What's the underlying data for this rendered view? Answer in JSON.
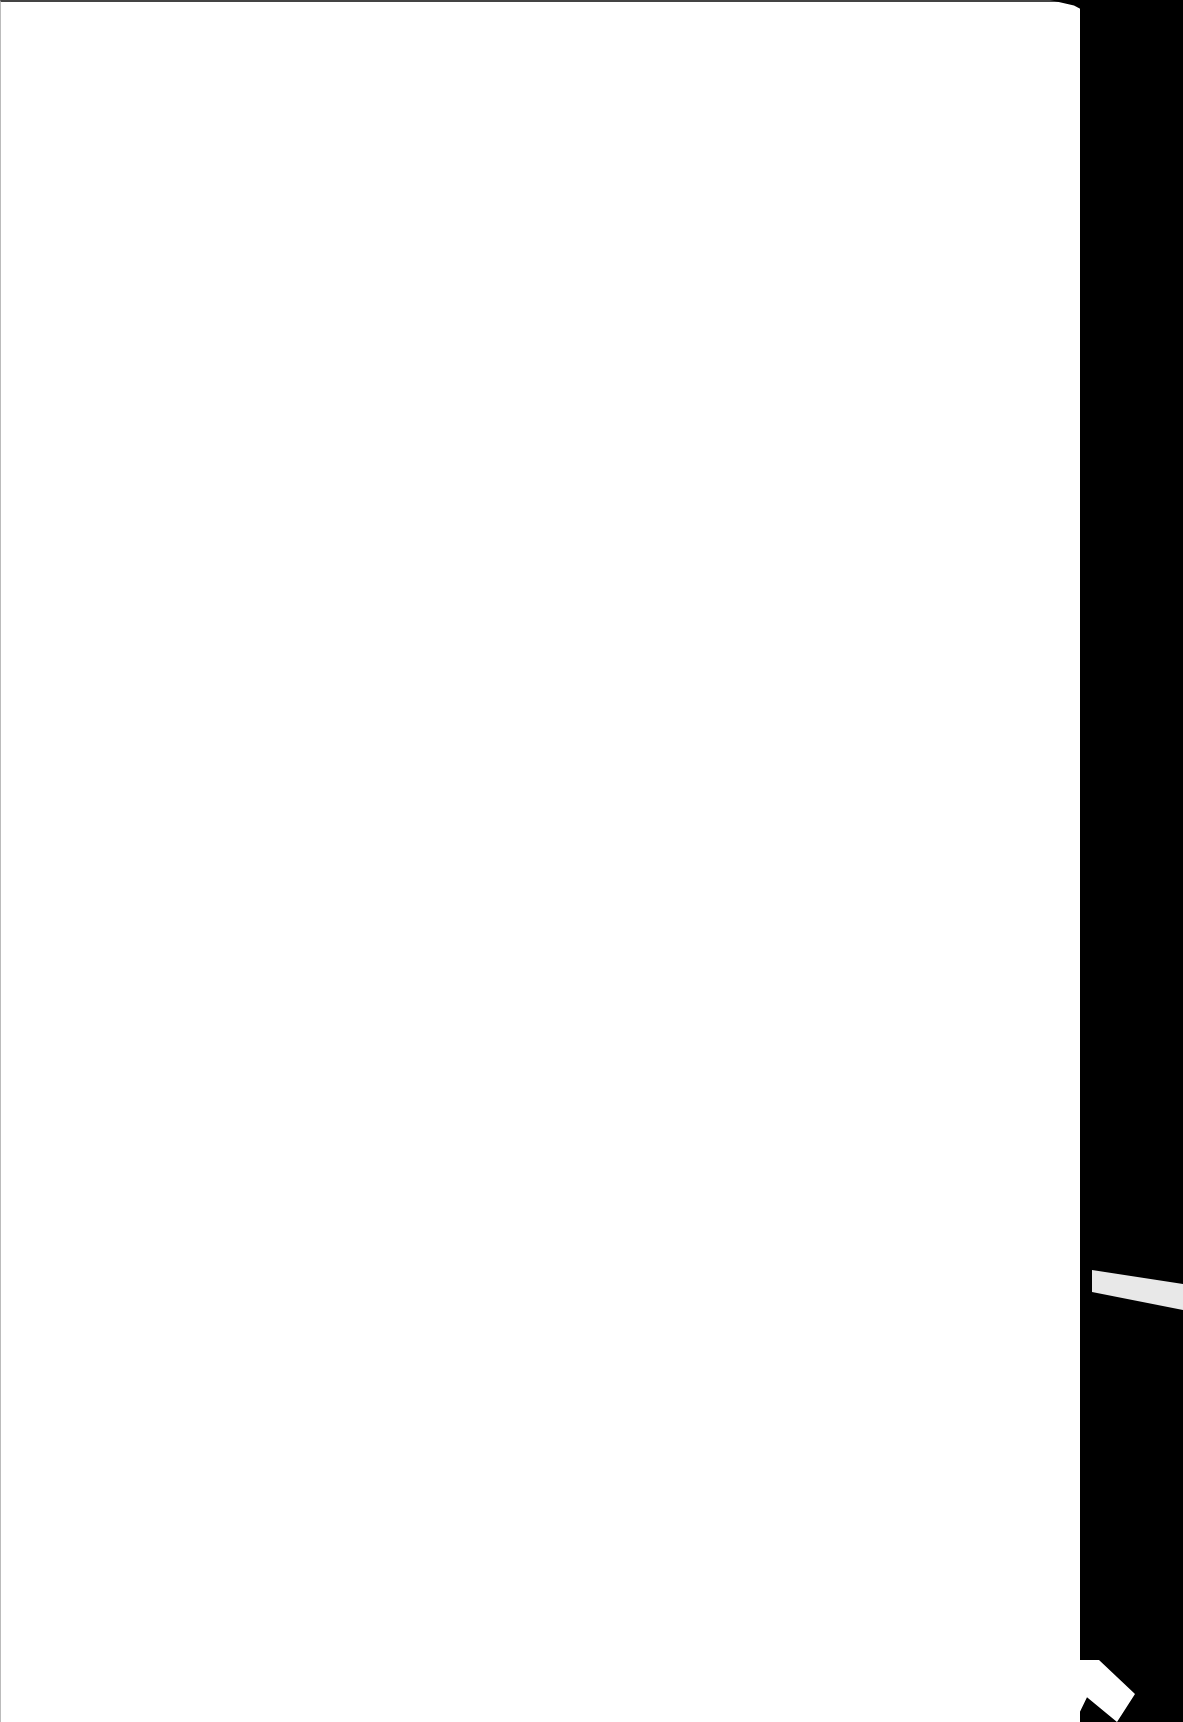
{
  "document": {
    "type": "scanned-page",
    "content": "",
    "colors": {
      "page": "#ffffff",
      "scanner_background": "#000000",
      "strip": "#e8e8e8"
    }
  }
}
